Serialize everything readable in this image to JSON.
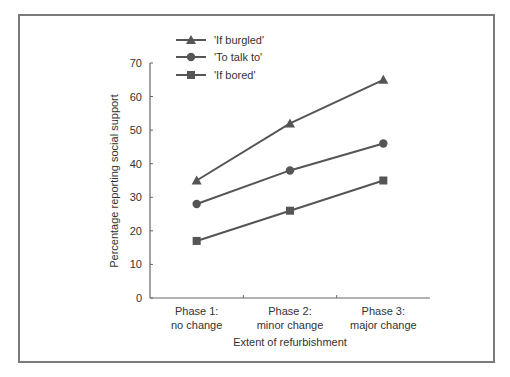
{
  "chart_data": {
    "type": "line",
    "title": "",
    "xlabel": "Extent of refurbishment",
    "ylabel": "Percentage reporting social support",
    "ylim": [
      0,
      70
    ],
    "yticks": [
      0,
      10,
      20,
      30,
      40,
      50,
      60,
      70
    ],
    "grid": false,
    "legend_position": "top-left",
    "categories": [
      [
        "Phase 1:",
        "no change"
      ],
      [
        "Phase 2:",
        "minor change"
      ],
      [
        "Phase 3:",
        "major change"
      ]
    ],
    "series": [
      {
        "name": "'If burgled'",
        "marker": "triangle",
        "values": [
          35,
          52,
          65
        ]
      },
      {
        "name": "'To talk to'",
        "marker": "circle",
        "values": [
          28,
          38,
          46
        ]
      },
      {
        "name": "'If bored'",
        "marker": "square",
        "values": [
          17,
          26,
          35
        ]
      }
    ]
  },
  "style": {
    "line_color": "#555555",
    "axis_color": "#666666",
    "text_color": "#333333",
    "frame_color": "#7a7a7a"
  }
}
